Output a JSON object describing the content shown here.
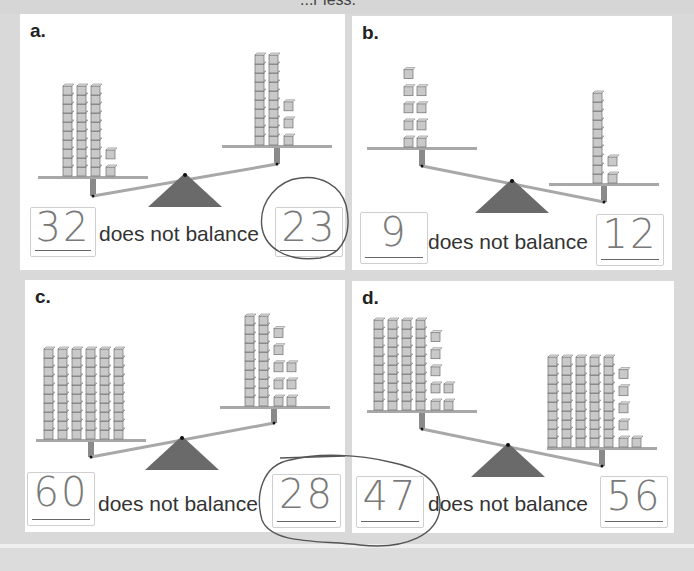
{
  "header_fragment": "...r less.",
  "caption_text": "does not balance",
  "colors": {
    "cube_fill": "#c9c9c9",
    "cube_stroke": "#6e6e6e",
    "plank": "#a8a8a8",
    "fulcrum": "#6a6a6a",
    "background": "#d9d9d9",
    "panel": "#ffffff"
  },
  "problems": [
    {
      "label": "a.",
      "left": {
        "tens": 3,
        "ones": 2
      },
      "right": {
        "tens": 2,
        "ones": 3
      },
      "tilt": "left-down",
      "left_answer": "32",
      "right_answer": "23",
      "circled": "right"
    },
    {
      "label": "b.",
      "left": {
        "tens": 0,
        "ones": 9
      },
      "right": {
        "tens": 1,
        "ones": 2
      },
      "tilt": "right-down",
      "left_answer": "9",
      "right_answer": "12",
      "circled": "none"
    },
    {
      "label": "c.",
      "left": {
        "tens": 6,
        "ones": 0
      },
      "right": {
        "tens": 2,
        "ones": 8
      },
      "tilt": "left-down",
      "left_answer": "60",
      "right_answer": "28",
      "circled": "right"
    },
    {
      "label": "d.",
      "left": {
        "tens": 4,
        "ones": 7
      },
      "right": {
        "tens": 5,
        "ones": 6
      },
      "tilt": "right-down",
      "left_answer": "47",
      "right_answer": "56",
      "circled": "left"
    }
  ]
}
